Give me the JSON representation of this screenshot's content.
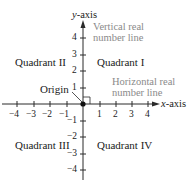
{
  "diagram": {
    "axes": {
      "x_label_var": "x",
      "x_label_suffix": "-axis",
      "y_label_var": "y",
      "y_label_suffix": "-axis",
      "x_ticks": [
        "−4",
        "−3",
        "−2",
        "−1",
        "1",
        "2",
        "3",
        "4"
      ],
      "y_ticks": [
        "4",
        "3",
        "2",
        "1",
        "−1",
        "−2",
        "−3",
        "−4"
      ]
    },
    "quadrants": {
      "q1": "Quadrant I",
      "q2": "Quadrant II",
      "q3": "Quadrant III",
      "q4": "Quadrant IV"
    },
    "origin_label": "Origin",
    "annotations": {
      "vertical_line1": "Vertical real",
      "vertical_line2": "number line",
      "horizontal_line1": "Horizontal real",
      "horizontal_line2": "number line"
    },
    "colors": {
      "axis": "#2a2a2a",
      "text": "#1a1a1a",
      "annotation": "#8a8a8a"
    }
  }
}
